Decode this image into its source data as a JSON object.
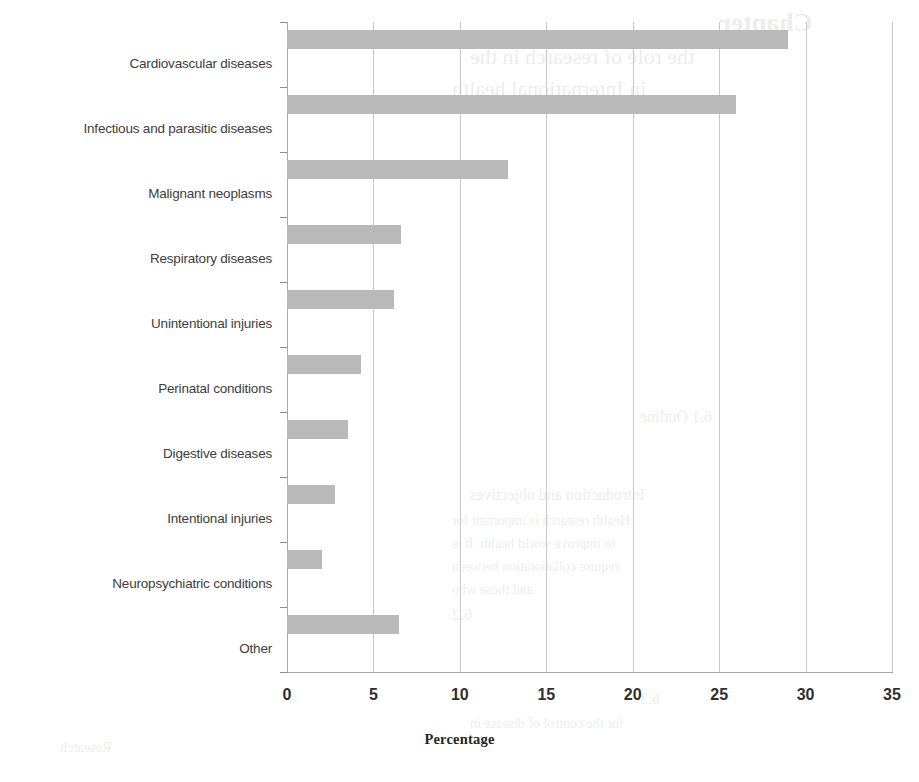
{
  "chart_data": {
    "type": "bar",
    "orientation": "horizontal",
    "title": "",
    "xlabel": "Percentage",
    "ylabel": "",
    "xlim": [
      0,
      35
    ],
    "xticks": [
      0,
      5,
      10,
      15,
      20,
      25,
      30,
      35
    ],
    "grid": "vertical",
    "legend": "none",
    "bar_color": "#b9b9b9",
    "categories": [
      "Cardiovascular diseases",
      "Infectious and parasitic diseases",
      "Malignant neoplasms",
      "Respiratory diseases",
      "Unintentional injuries",
      "Perinatal conditions",
      "Digestive diseases",
      "Intentional injuries",
      "Neuropsychiatric conditions",
      "Other"
    ],
    "values": [
      29.0,
      26.0,
      12.8,
      6.6,
      6.2,
      4.3,
      3.5,
      2.8,
      2.0,
      6.5
    ]
  },
  "axis": {
    "x_tick_labels": [
      "0",
      "5",
      "10",
      "15",
      "20",
      "25",
      "30",
      "35"
    ],
    "x_axis_title": "Percentage"
  },
  "bleed_text": [
    "Chapter",
    "the role of research in the",
    "in International health",
    "6.1 Outline",
    "Introduction and objectives",
    "Health research is important for",
    "to improve world health. It is",
    "require collaboration between",
    "and those who",
    "6.2",
    "6.3",
    "for the control of disease in",
    "Research"
  ]
}
